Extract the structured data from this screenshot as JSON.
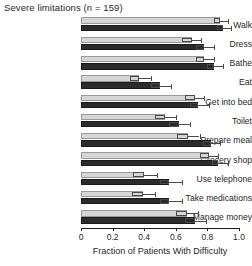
{
  "chart_data": {
    "type": "bar",
    "orientation": "horizontal",
    "title": "Severe limitations (n = 159)",
    "xlabel": "Fraction of Patients With Difficulty",
    "ylabel": "",
    "xlim": [
      0,
      1.0
    ],
    "xticks": [
      0,
      0.2,
      0.4,
      0.6,
      0.8,
      1.0
    ],
    "xtick_labels": [
      "0",
      "0.2",
      "0.4",
      "0.6",
      "0.8",
      "1.0"
    ],
    "grid": false,
    "legend": "none",
    "categories": [
      "Walk",
      "Dress",
      "Bathe",
      "Eat",
      "Get into bed",
      "Toilet",
      "Prepare meal",
      "Grocery shop",
      "Use telephone",
      "Take medications",
      "Manage money"
    ],
    "series": [
      {
        "name": "light",
        "color": "#d6d6d6",
        "values": [
          0.88,
          0.7,
          0.78,
          0.37,
          0.72,
          0.53,
          0.68,
          0.81,
          0.4,
          0.39,
          0.67
        ],
        "err_low": [
          0.84,
          0.64,
          0.73,
          0.31,
          0.66,
          0.47,
          0.61,
          0.75,
          0.33,
          0.32,
          0.6
        ],
        "err_high": [
          0.93,
          0.76,
          0.84,
          0.44,
          0.78,
          0.6,
          0.75,
          0.87,
          0.48,
          0.47,
          0.74
        ]
      },
      {
        "name": "dark",
        "color": "#2b2b2b",
        "values": [
          0.9,
          0.78,
          0.84,
          0.5,
          0.74,
          0.62,
          0.82,
          0.87,
          0.56,
          0.56,
          0.72
        ],
        "err_low": [
          0.86,
          0.73,
          0.8,
          0.44,
          0.69,
          0.56,
          0.77,
          0.83,
          0.5,
          0.5,
          0.66
        ],
        "err_high": [
          0.95,
          0.84,
          0.9,
          0.57,
          0.81,
          0.69,
          0.88,
          0.93,
          0.64,
          0.64,
          0.79
        ]
      }
    ]
  },
  "axis": {
    "x_label": "Fraction of Patients With Difficulty"
  },
  "title": {
    "text": "Severe limitations (n = 159)"
  }
}
